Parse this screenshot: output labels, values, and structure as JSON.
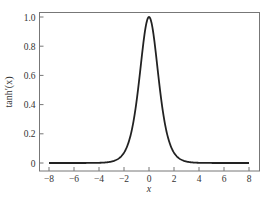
{
  "chart_data": {
    "type": "line",
    "title": "",
    "xlabel": "x",
    "ylabel": "tanh′(x)",
    "xlim": [
      -8.8,
      8.8
    ],
    "ylim": [
      -0.05,
      1.05
    ],
    "x_ticks": [
      -8,
      -6,
      -4,
      -2,
      0,
      2,
      4,
      6,
      8
    ],
    "x_tick_labels": [
      "−8",
      "−6",
      "−4",
      "−2",
      "0",
      "2",
      "4",
      "6",
      "8"
    ],
    "y_ticks": [
      0,
      0.2,
      0.4,
      0.6,
      0.8,
      1.0
    ],
    "y_tick_labels": [
      "0",
      "0.2",
      "0.4",
      "0.6",
      "0.8",
      "1.0"
    ],
    "grid": false,
    "legend": null,
    "series": [
      {
        "name": "tanh'(x) = sech²(x)",
        "color": "#222222",
        "x": [
          -8,
          -6,
          -4,
          -3,
          -2.5,
          -2,
          -1.5,
          -1,
          -0.75,
          -0.5,
          -0.25,
          0,
          0.25,
          0.5,
          0.75,
          1,
          1.5,
          2,
          2.5,
          3,
          4,
          6,
          8
        ],
        "y": [
          0.0,
          0.0,
          0.001,
          0.01,
          0.026,
          0.071,
          0.181,
          0.42,
          0.597,
          0.786,
          0.94,
          1.0,
          0.94,
          0.786,
          0.597,
          0.42,
          0.181,
          0.071,
          0.026,
          0.01,
          0.001,
          0.0,
          0.0
        ]
      }
    ]
  }
}
